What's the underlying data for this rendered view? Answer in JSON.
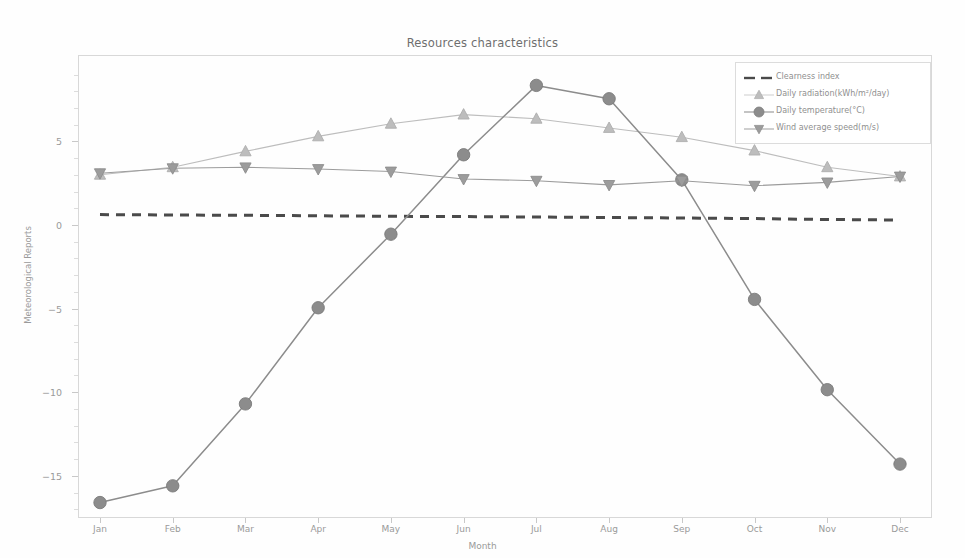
{
  "chart_data": {
    "type": "line",
    "title": "Resources characteristics",
    "xlabel": "Month",
    "ylabel": "Meteorological Reports",
    "categories": [
      "Jan",
      "Feb",
      "Mar",
      "Apr",
      "May",
      "Jun",
      "Jul",
      "Aug",
      "Sep",
      "Oct",
      "Nov",
      "Dec"
    ],
    "ylim": [
      -18.5,
      9.8
    ],
    "yticks": [
      5,
      0,
      -5,
      -10,
      -15
    ],
    "grid": false,
    "legend_position": "upper right",
    "series": [
      {
        "name": "Clearness index",
        "style": "dashed",
        "marker": "none",
        "color": "#4a4a4a",
        "values": [
          0.62,
          0.6,
          0.58,
          0.55,
          0.52,
          0.5,
          0.48,
          0.45,
          0.42,
          0.38,
          0.33,
          0.3
        ]
      },
      {
        "name": "Daily radiation(kWh/m²/day)",
        "style": "solid",
        "marker": "triangle-up",
        "color": "#bdbdbd",
        "values": [
          3.0,
          3.45,
          4.4,
          5.3,
          6.05,
          6.6,
          6.35,
          5.8,
          5.25,
          4.45,
          3.45,
          2.9
        ]
      },
      {
        "name": "Daily temperature(°C)",
        "style": "solid",
        "marker": "circle",
        "color": "#8c8c8c",
        "values": [
          -16.6,
          -15.6,
          -10.7,
          -4.95,
          -0.55,
          4.2,
          8.35,
          7.55,
          2.7,
          -4.45,
          -9.85,
          -14.3
        ]
      },
      {
        "name": "Wind average speed(m/s)",
        "style": "solid",
        "marker": "triangle-down",
        "color": "#9c9c9c",
        "values": [
          3.1,
          3.4,
          3.45,
          3.35,
          3.2,
          2.75,
          2.65,
          2.4,
          2.65,
          2.35,
          2.55,
          2.9
        ]
      }
    ]
  },
  "axis": {
    "ytick_labels": [
      "5",
      "0",
      "−5",
      "−10",
      "−15"
    ],
    "xtick_labels": [
      "Jan",
      "Feb",
      "Mar",
      "Apr",
      "May",
      "Jun",
      "Jul",
      "Aug",
      "Sep",
      "Oct",
      "Nov",
      "Dec"
    ]
  },
  "legend": {
    "items": [
      {
        "label": "Clearness index",
        "marker": "dashed-line-swatch"
      },
      {
        "label": "Daily radiation(kWh/m²/day)",
        "marker": "triangle-up-marker"
      },
      {
        "label": "Daily temperature(°C)",
        "marker": "circle-marker"
      },
      {
        "label": "Wind average speed(m/s)",
        "marker": "triangle-down-marker"
      }
    ]
  },
  "colors": {
    "clearness": "#4a4a4a",
    "radiation": "#bdbdbd",
    "temperature": "#8c8c8c",
    "wind": "#9c9c9c",
    "frame": "#d8d8d8",
    "text": "#9a9a9a",
    "background": "#ffffff"
  }
}
